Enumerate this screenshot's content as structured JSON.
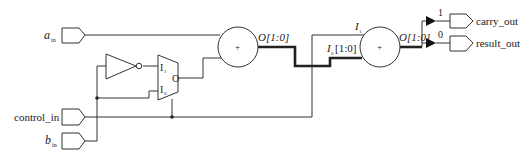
{
  "diagram": {
    "title": "",
    "inputs": {
      "a_in": {
        "main": "a",
        "sub": "in"
      },
      "control_in": {
        "label": "control_in"
      },
      "b_in": {
        "main": "b",
        "sub": "in"
      }
    },
    "mux": {
      "in1": {
        "main": "I",
        "sub": "1"
      },
      "in0": {
        "main": "I",
        "sub": "0"
      },
      "out": "O"
    },
    "adder1": {
      "symbol": "+",
      "out": "O[1:0]"
    },
    "adder2": {
      "symbol": "+",
      "in1": {
        "main": "I",
        "sub": "1"
      },
      "in0": {
        "main": "I",
        "sub": "0",
        "suffix": "[1:0]"
      },
      "out": "O[1:0]"
    },
    "split": {
      "bit1": "1",
      "bit0": "0"
    },
    "outputs": {
      "carry_out": "carry_out",
      "result_out": "result_out"
    }
  }
}
